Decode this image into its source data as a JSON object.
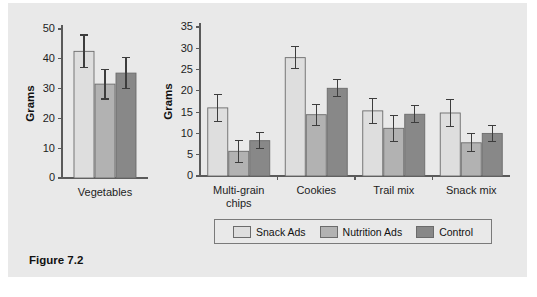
{
  "figure": {
    "caption": "Figure 7.2",
    "background_color": "#e9e9e9"
  },
  "legend": {
    "position": "bottom-center",
    "entries": [
      {
        "label": "Snack Ads",
        "color": "#dedede"
      },
      {
        "label": "Nutrition Ads",
        "color": "#b2b2b2"
      },
      {
        "label": "Control",
        "color": "#888888"
      }
    ]
  },
  "chart_data": [
    {
      "type": "bar",
      "title": "",
      "xlabel": "",
      "ylabel": "Grams",
      "categories": [
        "Vegetables"
      ],
      "ylim": [
        0,
        50
      ],
      "yticks": [
        0,
        10,
        20,
        30,
        40,
        50
      ],
      "grid": false,
      "legend_position": "bottom-center",
      "series": [
        {
          "name": "Snack Ads",
          "color": "#dedede",
          "values": [
            42.5
          ],
          "errors": [
            5.5
          ]
        },
        {
          "name": "Nutrition Ads",
          "color": "#b2b2b2",
          "values": [
            31.5
          ],
          "errors": [
            5.0
          ]
        },
        {
          "name": "Control",
          "color": "#888888",
          "values": [
            35.2
          ],
          "errors": [
            5.3
          ]
        }
      ]
    },
    {
      "type": "bar",
      "title": "",
      "xlabel": "",
      "ylabel": "Grams",
      "categories": [
        "Multi-grain chips",
        "Cookies",
        "Trail mix",
        "Snack mix"
      ],
      "category_lines": [
        [
          "Multi-grain",
          "chips"
        ],
        [
          "Cookies"
        ],
        [
          "Trail mix"
        ],
        [
          "Snack mix"
        ]
      ],
      "ylim": [
        0,
        35
      ],
      "yticks": [
        0,
        5,
        10,
        15,
        20,
        25,
        30,
        35
      ],
      "grid": false,
      "legend_position": "bottom-center",
      "series": [
        {
          "name": "Snack Ads",
          "color": "#dedede",
          "values": [
            16.0,
            27.8,
            15.3,
            14.8
          ],
          "errors": [
            3.1,
            2.6,
            2.9,
            3.1
          ]
        },
        {
          "name": "Nutrition Ads",
          "color": "#b2b2b2",
          "values": [
            5.8,
            14.4,
            11.2,
            7.8
          ],
          "errors": [
            2.6,
            2.5,
            3.0,
            2.1
          ]
        },
        {
          "name": "Control",
          "color": "#888888",
          "values": [
            8.3,
            20.6,
            14.5,
            10.0
          ],
          "errors": [
            1.9,
            2.0,
            2.0,
            1.8
          ]
        }
      ]
    }
  ]
}
